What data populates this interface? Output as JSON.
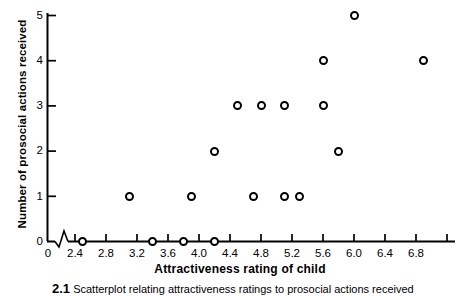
{
  "chart_data": {
    "type": "scatter",
    "title": "",
    "xlabel": "Attractiveness rating of child",
    "ylabel": "Number of prosocial actions received",
    "xlim": [
      2.2,
      7.0
    ],
    "ylim": [
      0,
      5
    ],
    "grid": false,
    "legend": null,
    "x_axis_break": true,
    "x_origin_label": "0",
    "xticks": [
      "2.4",
      "2.8",
      "3.2",
      "3.6",
      "4.0",
      "4.4",
      "4.8",
      "5.2",
      "5.6",
      "6.0",
      "6.4",
      "6.8"
    ],
    "xtick_values": [
      2.4,
      2.8,
      3.2,
      3.6,
      4.0,
      4.4,
      4.8,
      5.2,
      5.6,
      6.0,
      6.4,
      6.8
    ],
    "yticks": [
      "0",
      "1",
      "2",
      "3",
      "4",
      "5"
    ],
    "ytick_values": [
      0,
      1,
      2,
      3,
      4,
      5
    ],
    "marker_style": "open-circle",
    "marker_color": "#000000",
    "points": [
      {
        "x": 2.5,
        "y": 0
      },
      {
        "x": 3.4,
        "y": 0
      },
      {
        "x": 3.8,
        "y": 0
      },
      {
        "x": 4.2,
        "y": 0
      },
      {
        "x": 3.1,
        "y": 1
      },
      {
        "x": 3.9,
        "y": 1
      },
      {
        "x": 4.7,
        "y": 1
      },
      {
        "x": 5.1,
        "y": 1
      },
      {
        "x": 5.3,
        "y": 1
      },
      {
        "x": 4.2,
        "y": 2
      },
      {
        "x": 5.8,
        "y": 2
      },
      {
        "x": 4.5,
        "y": 3
      },
      {
        "x": 4.8,
        "y": 3
      },
      {
        "x": 5.1,
        "y": 3
      },
      {
        "x": 5.6,
        "y": 3
      },
      {
        "x": 5.6,
        "y": 4
      },
      {
        "x": 6.9,
        "y": 4
      },
      {
        "x": 6.0,
        "y": 5
      }
    ]
  },
  "caption": {
    "number": "2.1",
    "text": "Scatterplot  relating  attractiveness  ratings  to  prosocial  actions  received"
  }
}
